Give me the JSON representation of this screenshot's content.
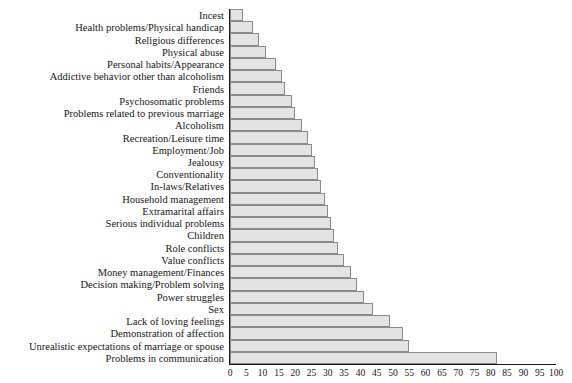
{
  "chart": {
    "title": "",
    "xlabel": "",
    "ylabel": ""
  },
  "chart_data": {
    "type": "bar",
    "orientation": "horizontal",
    "title": "",
    "xlabel": "",
    "ylabel": "",
    "xlim": [
      0,
      100
    ],
    "grid": false,
    "legend": null,
    "axis_ticks": [
      "0",
      "5",
      "10",
      "15",
      "20",
      "25",
      "30",
      "35",
      "40",
      "45",
      "50",
      "55",
      "60",
      "65",
      "70",
      "75",
      "80",
      "85",
      "90",
      "95",
      "100"
    ],
    "bar_fill_color": "#e3e3e3",
    "bar_border_color": "#8a8a8a",
    "axis_color": "#1a1a1a",
    "categories": [
      "Incest",
      "Health problems/Physical handicap",
      "Religious differences",
      "Physical abuse",
      "Personal habits/Appearance",
      "Addictive behavior other than alcoholism",
      "Friends",
      "Psychosomatic problems",
      "Problems related to previous marriage",
      "Alcoholism",
      "Recreation/Leisure time",
      "Employment/Job",
      "Jealousy",
      "Conventionality",
      "In-laws/Relatives",
      "Household management",
      "Extramarital affairs",
      "Serious individual problems",
      "Children",
      "Role conflicts",
      "Value conflicts",
      "Money management/Finances",
      "Decision making/Problem solving",
      "Power struggles",
      "Sex",
      "Lack of loving feelings",
      "Demonstration of affection",
      "Unrealistic expectations of marriage or spouse",
      "Problems in communication"
    ],
    "values": [
      4,
      7,
      9,
      11,
      14,
      16,
      17,
      19,
      20,
      22,
      24,
      25,
      26,
      27,
      28,
      29,
      30,
      31,
      32,
      33,
      35,
      37,
      39,
      41,
      44,
      49,
      53,
      55,
      82
    ]
  }
}
